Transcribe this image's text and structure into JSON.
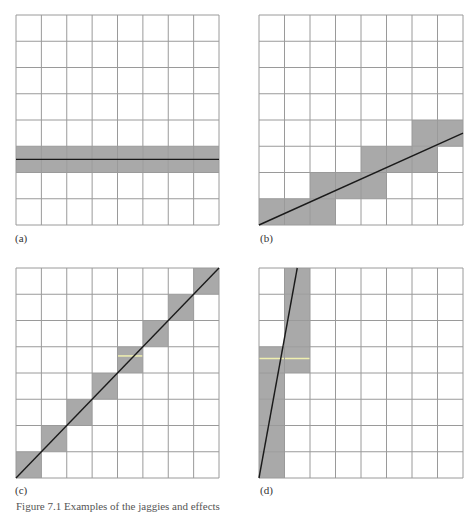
{
  "figure": {
    "grid": {
      "cols": 8,
      "rows": 8
    },
    "colors": {
      "grid_line": "#9a9a9a",
      "shade": "#a9a9a9",
      "line": "#1a1a1a",
      "highlight": "#f0f0b0"
    },
    "panels": [
      {
        "id": "a",
        "label": "(a)",
        "origin": [
          16,
          15
        ],
        "size": [
          203,
          210
        ],
        "shaded_cells": [
          [
            0,
            5
          ],
          [
            1,
            5
          ],
          [
            2,
            5
          ],
          [
            3,
            5
          ],
          [
            4,
            5
          ],
          [
            5,
            5
          ],
          [
            6,
            5
          ],
          [
            7,
            5
          ]
        ],
        "line": [
          [
            0,
            5.5
          ],
          [
            8,
            5.5
          ]
        ],
        "highlight": null
      },
      {
        "id": "b",
        "label": "(b)",
        "origin": [
          259,
          15
        ],
        "size": [
          204,
          210
        ],
        "shaded_cells": [
          [
            0,
            7
          ],
          [
            1,
            7
          ],
          [
            2,
            7
          ],
          [
            2,
            6
          ],
          [
            3,
            6
          ],
          [
            4,
            6
          ],
          [
            4,
            5
          ],
          [
            5,
            5
          ],
          [
            6,
            5
          ],
          [
            6,
            4
          ],
          [
            7,
            4
          ]
        ],
        "line": [
          [
            0,
            8
          ],
          [
            8,
            4.5
          ]
        ],
        "highlight": null
      },
      {
        "id": "c",
        "label": "(c)",
        "origin": [
          16,
          268
        ],
        "size": [
          203,
          210
        ],
        "shaded_cells": [
          [
            0,
            7
          ],
          [
            1,
            6
          ],
          [
            2,
            5
          ],
          [
            3,
            4
          ],
          [
            4,
            3
          ],
          [
            5,
            2
          ],
          [
            6,
            1
          ],
          [
            7,
            0
          ]
        ],
        "line": [
          [
            0,
            8
          ],
          [
            8,
            0
          ]
        ],
        "highlight": [
          [
            4,
            3.35
          ],
          [
            5,
            3.35
          ]
        ]
      },
      {
        "id": "d",
        "label": "(d)",
        "origin": [
          259,
          268
        ],
        "size": [
          204,
          210
        ],
        "shaded_cells": [
          [
            1,
            0
          ],
          [
            1,
            1
          ],
          [
            1,
            2
          ],
          [
            1,
            3
          ],
          [
            0,
            3
          ],
          [
            0,
            4
          ],
          [
            0,
            5
          ],
          [
            0,
            6
          ],
          [
            0,
            7
          ]
        ],
        "line": [
          [
            0,
            8
          ],
          [
            1.5,
            0
          ]
        ],
        "highlight": [
          [
            0,
            3.45
          ],
          [
            2,
            3.45
          ]
        ]
      }
    ]
  },
  "caption": "Figure 7.1    Examples of the jaggies and effects"
}
